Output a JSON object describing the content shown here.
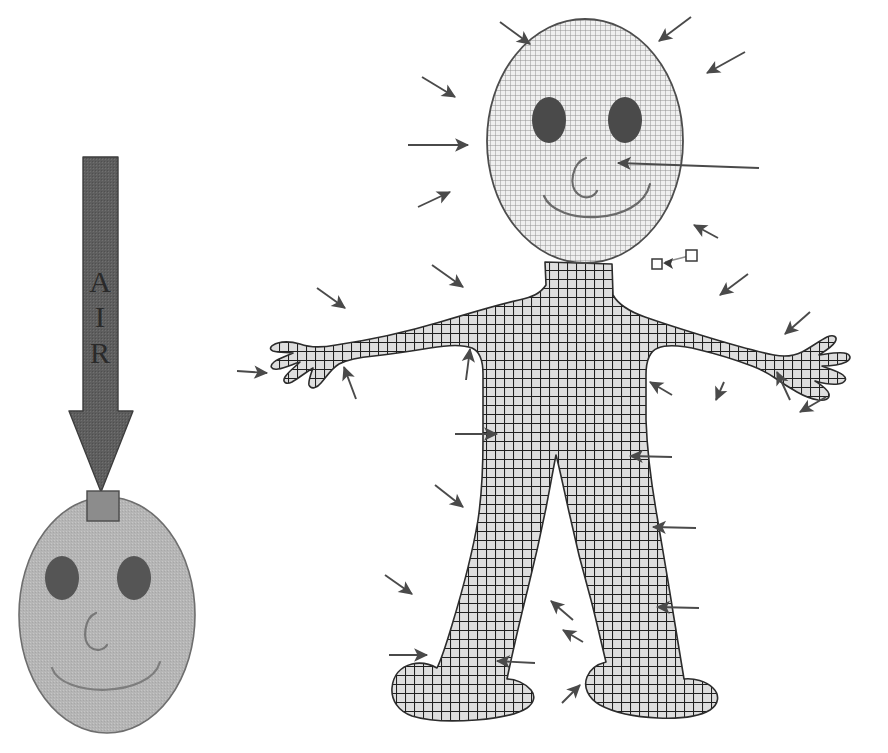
{
  "diagram": {
    "background_color": "#ffffff",
    "width": 888,
    "height": 753
  },
  "air_arrow": {
    "label": "AIR",
    "label_letters": [
      "A",
      "I",
      "R"
    ],
    "direction": "down",
    "color": "#565656",
    "outline_color": "#3d3d3d",
    "shaft": {
      "x": 83,
      "y": 157,
      "width": 35,
      "height": 255
    },
    "head": {
      "left_x": 69,
      "right_x": 133,
      "top_y": 410,
      "tip_x": 100,
      "tip_y": 492
    }
  },
  "head_model": {
    "name": "head-manikin",
    "fill_color": "#b3b3b3",
    "outline_color": "#6e6e6e",
    "ellipse": {
      "cx": 107,
      "cy": 615,
      "rx": 88,
      "ry": 118
    },
    "eye_color": "#555555",
    "eyes": [
      {
        "cx": 62,
        "cy": 578,
        "rx": 17,
        "ry": 22
      },
      {
        "cx": 134,
        "cy": 578,
        "rx": 17,
        "ry": 22
      }
    ],
    "inlet_box": {
      "x": 87,
      "y": 492,
      "width": 32,
      "height": 29,
      "fill": "#8c8c8c",
      "stroke": "#4d4d4d"
    },
    "features": [
      "nose",
      "smile-mouth"
    ]
  },
  "body_model": {
    "name": "full-body-manikin",
    "head_fill": "#e6e6e6",
    "head_hatch_color": "#7d7d7d",
    "body_fill": "#d4d4d4",
    "body_hatch_color": "#1f1f1f",
    "outline_color": "#333333",
    "eye_color": "#4a4a4a",
    "head_ellipse": {
      "cx": 585,
      "cy": 140,
      "rx": 98,
      "ry": 122
    },
    "eyes": [
      {
        "cx": 549,
        "cy": 120,
        "rx": 17,
        "ry": 23
      },
      {
        "cx": 625,
        "cy": 120,
        "rx": 17,
        "ry": 23
      }
    ],
    "features": [
      "nose",
      "smile-mouth",
      "torso",
      "left-arm",
      "right-arm",
      "left-hand",
      "right-hand",
      "left-leg",
      "right-leg",
      "left-foot",
      "right-foot"
    ]
  },
  "sensor_marker": {
    "name": "sensor-probe-marker",
    "square_fill": "#ffffff",
    "square_stroke": "#3a3a3a",
    "line_color": "#7a7a7a",
    "arrow_color": "#3a3a3a",
    "squares": [
      {
        "x": 653,
        "y": 260,
        "size": 9
      },
      {
        "x": 687,
        "y": 252,
        "size": 10
      }
    ],
    "arrow_tip": {
      "x": 666,
      "y": 262
    }
  },
  "flow_arrows": {
    "name": "airflow-arrows",
    "color": "#4a4a4a",
    "count": 30,
    "description": "Inward-pointing arrows indicating convective airflow onto the manikin from all directions",
    "items": [
      {
        "x1": 500,
        "y1": 22,
        "x2": 530,
        "y2": 44
      },
      {
        "x1": 691,
        "y1": 17,
        "x2": 659,
        "y2": 41
      },
      {
        "x1": 745,
        "y1": 52,
        "x2": 707,
        "y2": 73
      },
      {
        "x1": 422,
        "y1": 77,
        "x2": 455,
        "y2": 97
      },
      {
        "x1": 408,
        "y1": 145,
        "x2": 468,
        "y2": 145
      },
      {
        "x1": 759,
        "y1": 168,
        "x2": 618,
        "y2": 163
      },
      {
        "x1": 418,
        "y1": 207,
        "x2": 450,
        "y2": 192
      },
      {
        "x1": 718,
        "y1": 238,
        "x2": 694,
        "y2": 225
      },
      {
        "x1": 432,
        "y1": 265,
        "x2": 463,
        "y2": 287
      },
      {
        "x1": 317,
        "y1": 288,
        "x2": 345,
        "y2": 308
      },
      {
        "x1": 748,
        "y1": 274,
        "x2": 720,
        "y2": 295
      },
      {
        "x1": 810,
        "y1": 312,
        "x2": 785,
        "y2": 334
      },
      {
        "x1": 237,
        "y1": 371,
        "x2": 267,
        "y2": 373
      },
      {
        "x1": 356,
        "y1": 399,
        "x2": 344,
        "y2": 367
      },
      {
        "x1": 466,
        "y1": 380,
        "x2": 470,
        "y2": 349
      },
      {
        "x1": 790,
        "y1": 400,
        "x2": 777,
        "y2": 372
      },
      {
        "x1": 455,
        "y1": 434,
        "x2": 497,
        "y2": 434
      },
      {
        "x1": 672,
        "y1": 457,
        "x2": 630,
        "y2": 456
      },
      {
        "x1": 435,
        "y1": 485,
        "x2": 463,
        "y2": 507
      },
      {
        "x1": 696,
        "y1": 528,
        "x2": 653,
        "y2": 527
      },
      {
        "x1": 385,
        "y1": 575,
        "x2": 412,
        "y2": 594
      },
      {
        "x1": 389,
        "y1": 655,
        "x2": 427,
        "y2": 655
      },
      {
        "x1": 699,
        "y1": 608,
        "x2": 657,
        "y2": 607
      },
      {
        "x1": 573,
        "y1": 620,
        "x2": 551,
        "y2": 601
      },
      {
        "x1": 583,
        "y1": 642,
        "x2": 563,
        "y2": 630
      },
      {
        "x1": 562,
        "y1": 703,
        "x2": 580,
        "y2": 685
      },
      {
        "x1": 535,
        "y1": 663,
        "x2": 497,
        "y2": 661
      },
      {
        "x1": 826,
        "y1": 397,
        "x2": 800,
        "y2": 412
      },
      {
        "x1": 672,
        "y1": 395,
        "x2": 650,
        "y2": 382
      },
      {
        "x1": 724,
        "y1": 382,
        "x2": 716,
        "y2": 400
      }
    ]
  }
}
